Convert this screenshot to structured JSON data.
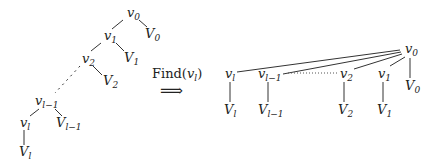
{
  "left_tree": {
    "nodes": {
      "v0": {
        "base": "v",
        "sub": "0"
      },
      "V0": {
        "base": "V",
        "sub": "0"
      },
      "v1": {
        "base": "v",
        "sub": "1"
      },
      "V1": {
        "base": "V",
        "sub": "1"
      },
      "v2": {
        "base": "v",
        "sub": "2"
      },
      "V2": {
        "base": "V",
        "sub": "2"
      },
      "vlm1": {
        "base": "v",
        "sub": "l−1"
      },
      "Vlm1": {
        "base": "V",
        "sub": "l−1"
      },
      "vl": {
        "base": "v",
        "sub": "l"
      },
      "Vl": {
        "base": "V",
        "sub": "l"
      }
    }
  },
  "operation": {
    "label": "Find(",
    "arg_base": "v",
    "arg_sub": "l",
    "close": ")",
    "arrow": "⟹"
  },
  "right_tree": {
    "root": {
      "base": "v",
      "sub": "0"
    },
    "root_child": {
      "base": "V",
      "sub": "0"
    },
    "children": [
      {
        "node": {
          "base": "v",
          "sub": "l"
        },
        "leaf": {
          "base": "V",
          "sub": "l"
        }
      },
      {
        "node": {
          "base": "v",
          "sub": "l−1"
        },
        "leaf": {
          "base": "V",
          "sub": "l−1"
        }
      },
      {
        "node": {
          "base": "v",
          "sub": "2"
        },
        "leaf": {
          "base": "V",
          "sub": "2"
        }
      },
      {
        "node": {
          "base": "v",
          "sub": "1"
        },
        "leaf": {
          "base": "V",
          "sub": "1"
        }
      }
    ]
  }
}
